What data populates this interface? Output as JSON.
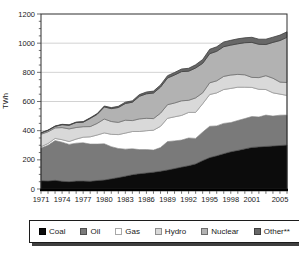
{
  "chart_data": {
    "type": "area",
    "stacked": true,
    "title": "",
    "xlabel": "",
    "ylabel": "TWh",
    "ylim": [
      0,
      1200
    ],
    "y_tick_step": 200,
    "y_ticks": [
      0,
      200,
      400,
      600,
      800,
      1000,
      1200
    ],
    "grid": "horizontal",
    "gridline_color": "#c6c6c6",
    "frame_color": "#2e2e2e",
    "axis_color": "#000000",
    "legend_position": "bottom",
    "x": [
      1971,
      1972,
      1973,
      1974,
      1975,
      1976,
      1977,
      1978,
      1979,
      1980,
      1981,
      1982,
      1983,
      1984,
      1985,
      1986,
      1987,
      1988,
      1989,
      1990,
      1991,
      1992,
      1993,
      1994,
      1995,
      1996,
      1997,
      1998,
      1999,
      2000,
      2001,
      2002,
      2003,
      2004,
      2005,
      2006
    ],
    "x_tick_labels": [
      "1971",
      "1974",
      "1977",
      "1980",
      "1983",
      "1986",
      "1989",
      "1992",
      "1995",
      "1998",
      "2001",
      "2005"
    ],
    "x_tick_years": [
      1971,
      1974,
      1977,
      1980,
      1983,
      1986,
      1989,
      1992,
      1995,
      1998,
      2001,
      2005
    ],
    "series": [
      {
        "key": "coal",
        "name": "Coal",
        "color": "#0c0c0c",
        "edge": "#000000",
        "swatch_border": "#000000",
        "values": [
          57,
          55,
          60,
          53,
          50,
          54,
          55,
          53,
          58,
          62,
          70,
          78,
          88,
          98,
          105,
          110,
          115,
          122,
          130,
          140,
          150,
          160,
          172,
          195,
          215,
          228,
          242,
          255,
          265,
          275,
          285,
          289,
          292,
          295,
          298,
          302
        ]
      },
      {
        "key": "oil",
        "name": "Oil",
        "color": "#7a7a7a",
        "edge": "#4f4f4f",
        "swatch_border": "#4f4f4f",
        "values": [
          224,
          245,
          272,
          268,
          256,
          260,
          262,
          255,
          250,
          248,
          220,
          200,
          185,
          178,
          165,
          160,
          152,
          162,
          195,
          190,
          185,
          190,
          175,
          195,
          215,
          205,
          208,
          200,
          205,
          208,
          212,
          205,
          215,
          205,
          208,
          205
        ]
      },
      {
        "key": "gas",
        "name": "Gas",
        "color": "#ffffff",
        "edge": "#9b9b9b",
        "swatch_border": "#a8a8a8",
        "values": [
          9,
          12,
          15,
          17,
          20,
          28,
          38,
          50,
          62,
          75,
          85,
          95,
          110,
          118,
          124,
          130,
          136,
          146,
          160,
          165,
          170,
          175,
          178,
          195,
          218,
          226,
          232,
          235,
          228,
          215,
          200,
          190,
          175,
          160,
          145,
          135
        ]
      },
      {
        "key": "hydro",
        "name": "Hydro",
        "color": "#d9d9d9",
        "edge": "#9b9b9b",
        "swatch_border": "#8e8e8e",
        "values": [
          86,
          80,
          72,
          83,
          86,
          80,
          72,
          70,
          80,
          95,
          88,
          84,
          89,
          75,
          87,
          85,
          80,
          90,
          93,
          95,
          100,
          83,
          100,
          75,
          80,
          83,
          90,
          92,
          88,
          85,
          68,
          80,
          95,
          100,
          82,
          88
        ]
      },
      {
        "key": "nuclear",
        "name": "Nuclear",
        "color": "#b2b2b2",
        "edge": "#6e6e6e",
        "swatch_border": "#6e6e6e",
        "values": [
          8,
          10,
          10,
          20,
          25,
          34,
          31,
          56,
          62,
          83,
          88,
          102,
          114,
          126,
          155,
          168,
          175,
          179,
          183,
          192,
          200,
          200,
          205,
          202,
          200,
          202,
          204,
          205,
          210,
          220,
          240,
          228,
          214,
          245,
          285,
          310
        ]
      },
      {
        "key": "other",
        "name": "Other**",
        "color": "#676767",
        "edge": "#3f3f3f",
        "swatch_border": "#3f3f3f",
        "values": [
          2,
          2,
          3,
          3,
          3,
          3,
          4,
          4,
          5,
          6,
          7,
          8,
          9,
          10,
          11,
          12,
          13,
          14,
          16,
          17,
          18,
          20,
          22,
          26,
          30,
          31,
          32,
          33,
          34,
          34,
          35,
          35,
          36,
          36,
          37,
          38
        ]
      }
    ]
  }
}
